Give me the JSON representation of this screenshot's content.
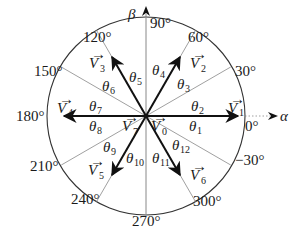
{
  "diagram": {
    "type": "space-vector-hexagon-circle",
    "axes": {
      "horizontal": "α",
      "vertical": "β"
    },
    "angle_labels": [
      {
        "text": "90°",
        "deg": 90
      },
      {
        "text": "60°",
        "deg": 60
      },
      {
        "text": "30°",
        "deg": 30
      },
      {
        "text": "0°",
        "deg": 0
      },
      {
        "text": "−30°",
        "deg": -30
      },
      {
        "text": "300°",
        "deg": 300
      },
      {
        "text": "270°",
        "deg": 270
      },
      {
        "text": "240°",
        "deg": 240
      },
      {
        "text": "210°",
        "deg": 210
      },
      {
        "text": "180°",
        "deg": 180
      },
      {
        "text": "150°",
        "deg": 150
      },
      {
        "text": "120°",
        "deg": 120
      }
    ],
    "vectors": [
      {
        "name": "V",
        "sub": "1",
        "deg": 0
      },
      {
        "name": "V",
        "sub": "2",
        "deg": 60
      },
      {
        "name": "V",
        "sub": "3",
        "deg": 120
      },
      {
        "name": "V",
        "sub": "4",
        "deg": 180
      },
      {
        "name": "V",
        "sub": "5",
        "deg": 240
      },
      {
        "name": "V",
        "sub": "6",
        "deg": 300
      },
      {
        "name": "V",
        "sub": "0",
        "deg": null
      },
      {
        "name": "V",
        "sub": "7",
        "deg": null
      }
    ],
    "sectors": [
      {
        "name": "θ",
        "sub": "1"
      },
      {
        "name": "θ",
        "sub": "2"
      },
      {
        "name": "θ",
        "sub": "3"
      },
      {
        "name": "θ",
        "sub": "4"
      },
      {
        "name": "θ",
        "sub": "5"
      },
      {
        "name": "θ",
        "sub": "6"
      },
      {
        "name": "θ",
        "sub": "7"
      },
      {
        "name": "θ",
        "sub": "8"
      },
      {
        "name": "θ",
        "sub": "9"
      },
      {
        "name": "θ",
        "sub": "10"
      },
      {
        "name": "θ",
        "sub": "11"
      },
      {
        "name": "θ",
        "sub": "12"
      }
    ]
  }
}
